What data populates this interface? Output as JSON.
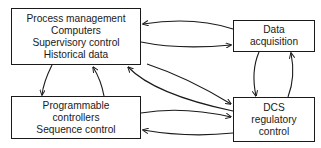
{
  "diagram": {
    "type": "block-diagram",
    "nodes": [
      {
        "id": "process",
        "lines": [
          "Process management",
          "Computers",
          "Supervisory control",
          "Historical data"
        ]
      },
      {
        "id": "data_acquisition",
        "lines": [
          "Data",
          "acquisition"
        ]
      },
      {
        "id": "programmable",
        "lines": [
          "Programmable",
          "controllers",
          "Sequence control"
        ]
      },
      {
        "id": "dcs",
        "lines": [
          "DCS",
          "regulatory",
          "control"
        ]
      }
    ],
    "edges": [
      {
        "from": "data_acquisition",
        "to": "process"
      },
      {
        "from": "process",
        "to": "data_acquisition"
      },
      {
        "from": "process",
        "to": "dcs"
      },
      {
        "from": "dcs",
        "to": "process"
      },
      {
        "from": "process",
        "to": "programmable"
      },
      {
        "from": "programmable",
        "to": "process"
      },
      {
        "from": "programmable",
        "to": "dcs"
      },
      {
        "from": "dcs",
        "to": "programmable"
      },
      {
        "from": "data_acquisition",
        "to": "dcs"
      },
      {
        "from": "dcs",
        "to": "data_acquisition"
      }
    ],
    "colors": {
      "line": "#1a1a1a",
      "background": "#ffffff"
    }
  }
}
